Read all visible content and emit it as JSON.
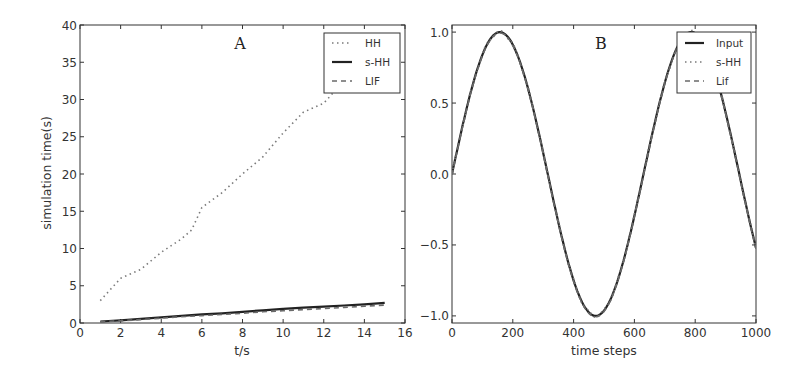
{
  "chart_data": [
    {
      "panel": "A",
      "type": "line",
      "title": "A",
      "xlabel": "t/s",
      "ylabel": "simulation time(s)",
      "xlim": [
        0,
        16
      ],
      "ylim": [
        0,
        40
      ],
      "xticks": [
        0,
        2,
        4,
        6,
        8,
        10,
        12,
        14,
        16
      ],
      "yticks": [
        0,
        5,
        10,
        15,
        20,
        25,
        30,
        35,
        40
      ],
      "grid": false,
      "legend_position": "upper right",
      "series": [
        {
          "name": "HH",
          "style": "dotted",
          "color": "#7a7a7a",
          "x": [
            1,
            2,
            3,
            4,
            5,
            5.5,
            6,
            7,
            8,
            9,
            10,
            11,
            12,
            12.5
          ],
          "y": [
            3.0,
            6.0,
            7.2,
            9.5,
            11.3,
            12.5,
            15.5,
            17.5,
            20.0,
            22.3,
            25.5,
            28.3,
            29.5,
            31.0
          ]
        },
        {
          "name": "s-HH",
          "style": "solid",
          "color": "#222222",
          "x": [
            1,
            2,
            3,
            4,
            5,
            6,
            7,
            8,
            9,
            10,
            11,
            12,
            13,
            14,
            15
          ],
          "y": [
            0.2,
            0.35,
            0.55,
            0.75,
            0.95,
            1.15,
            1.3,
            1.5,
            1.7,
            1.9,
            2.05,
            2.2,
            2.35,
            2.5,
            2.7
          ]
        },
        {
          "name": "LIF",
          "style": "dashed",
          "color": "#6a6a6a",
          "x": [
            1,
            2,
            3,
            4,
            5,
            6,
            7,
            8,
            9,
            10,
            11,
            12,
            13,
            14,
            15
          ],
          "y": [
            0.15,
            0.3,
            0.45,
            0.65,
            0.85,
            1.0,
            1.15,
            1.3,
            1.5,
            1.65,
            1.8,
            1.95,
            2.1,
            2.25,
            2.4
          ]
        }
      ]
    },
    {
      "panel": "B",
      "type": "line",
      "title": "B",
      "xlabel": "time steps",
      "ylabel": "",
      "xlim": [
        0,
        1000
      ],
      "ylim": [
        -1.05,
        1.05
      ],
      "xticks": [
        0,
        200,
        400,
        600,
        800,
        1000
      ],
      "yticks": [
        -1.0,
        -0.5,
        0.0,
        0.5,
        1.0
      ],
      "grid": false,
      "legend_position": "upper right",
      "description": "Sine input sin(2*pi*t/630) over 0-1000 time steps; s-HH and Lif outputs overlap input closely",
      "series": [
        {
          "name": "Input",
          "style": "solid",
          "color": "#222222",
          "x": [
            0,
            80,
            160,
            240,
            320,
            400,
            475,
            560,
            640,
            720,
            800,
            880,
            960,
            1000
          ],
          "y": [
            0.0,
            0.71,
            1.0,
            0.67,
            -0.03,
            -0.73,
            -1.0,
            -0.64,
            0.06,
            0.76,
            0.99,
            0.59,
            -0.1,
            -0.51
          ]
        },
        {
          "name": "s-HH",
          "style": "dotted",
          "color": "#7a7a7a",
          "x": [
            0,
            160,
            475,
            800,
            1000
          ],
          "y": [
            0.0,
            1.0,
            -1.0,
            0.99,
            -0.51
          ]
        },
        {
          "name": "Lif",
          "style": "dashed",
          "color": "#6a6a6a",
          "x": [
            0,
            160,
            475,
            800,
            1000
          ],
          "y": [
            0.0,
            1.0,
            -1.0,
            0.99,
            -0.51
          ]
        }
      ]
    }
  ],
  "panels": {
    "a": {
      "title": "A",
      "xlabel": "t/s",
      "ylabel": "simulation time(s)",
      "xtick_labels": [
        "0",
        "2",
        "4",
        "6",
        "8",
        "10",
        "12",
        "14",
        "16"
      ],
      "ytick_labels": [
        "0",
        "5",
        "10",
        "15",
        "20",
        "25",
        "30",
        "35",
        "40"
      ],
      "legend": [
        "HH",
        "s-HH",
        "LIF"
      ]
    },
    "b": {
      "title": "B",
      "xlabel": "time steps",
      "xtick_labels": [
        "0",
        "200",
        "400",
        "600",
        "800",
        "1000"
      ],
      "ytick_labels": [
        "−1.0",
        "−0.5",
        "0.0",
        "0.5",
        "1.0"
      ],
      "legend": [
        "Input",
        "s-HH",
        "Lif"
      ]
    }
  }
}
